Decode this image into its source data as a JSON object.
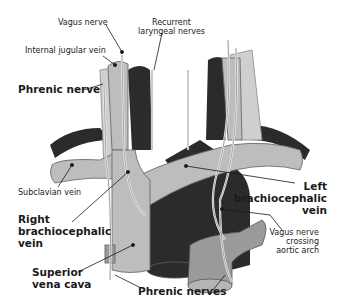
{
  "colors": {
    "vein": "#bdbdbd",
    "vein_outline": "#6b6b6b",
    "artery": "#2b2b2b",
    "nerve": "#e8e8e8",
    "muscle": "#cfcfcf",
    "text": "#1a1a1a"
  },
  "labels": {
    "vagus_nerve": "Vagus nerve",
    "recurrent_laryngeal": [
      "Recurrent",
      "laryngeal nerves"
    ],
    "internal_jugular_vein": "Internal jugular vein",
    "phrenic_nerve": "Phrenic nerve",
    "subclavian_vein": "Subclavian vein",
    "right_brachiocephalic_vein": [
      "Right",
      "brachiocephalic",
      "vein"
    ],
    "left_brachiocephalic_vein": [
      "Left",
      "brachiocephalic",
      "vein"
    ],
    "superior_vena_cava": [
      "Superior",
      "vena cava"
    ],
    "phrenic_nerves": "Phrenic nerves",
    "vagus_crossing": [
      "Vagus nerve",
      "crossing",
      "aortic arch"
    ]
  }
}
